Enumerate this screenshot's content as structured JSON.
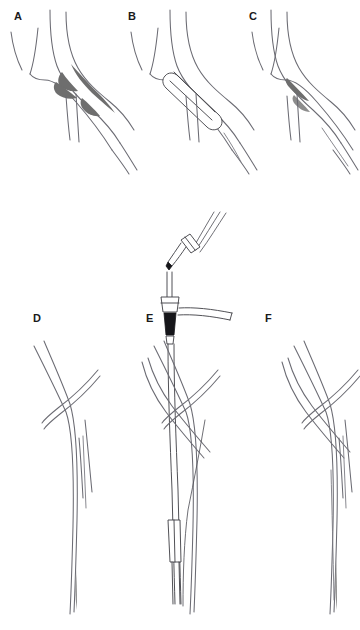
{
  "figure": {
    "kind": "medical-illustration",
    "style": "black-and-white line drawing",
    "background_color": "#ffffff",
    "line_color": "#6b6b73",
    "device_color": "#3d3d43",
    "plaque_color": "#6e6e6e",
    "valve_color": "#16161a",
    "label_color": "#1a1a1a",
    "panel_count": 6,
    "grid": "3 columns x 2 rows"
  },
  "panels": [
    {
      "id": "A",
      "label": "A",
      "label_x": 14,
      "label_y": 20,
      "row": 1,
      "column": 1,
      "content": "Arterial bifurcation with stenotic plaque shaded dark gray at the origin of the branch vessels"
    },
    {
      "id": "B",
      "label": "B",
      "label_x": 128,
      "label_y": 20,
      "row": 1,
      "column": 2,
      "content": "Elongated stent or balloon catheter deployed across the stenosis at the bifurcation"
    },
    {
      "id": "C",
      "label": "C",
      "label_x": 249,
      "label_y": 20,
      "row": 1,
      "column": 3,
      "content": "Bifurcation after treatment showing reduced residual plaque and restored lumen"
    },
    {
      "id": "D",
      "label": "D",
      "label_x": 33,
      "label_y": 322,
      "row": 2,
      "column": 1,
      "content": "Long arterial segment with crossing overlying vessels before device insertion"
    },
    {
      "id": "E",
      "label": "E",
      "label_x": 146,
      "label_y": 322,
      "row": 2,
      "column": 2,
      "content": "Introducer sheath with hemostatic valve hub and side-arm extension, access needle and guidewire connector above, catheter shaft advanced down the vessel with a distal marker band"
    },
    {
      "id": "F",
      "label": "F",
      "label_x": 265,
      "label_y": 322,
      "row": 2,
      "column": 3,
      "content": "Arterial segment after device removal showing patent vessel"
    }
  ],
  "device_parts": [
    {
      "name": "guidewire-connector",
      "description": "small cylindrical connector on angled guidewire at top of panel E"
    },
    {
      "name": "access-needle",
      "description": "tapered needle leading into the sheath hub"
    },
    {
      "name": "sheath-hub",
      "description": "hemostatic valve hub body"
    },
    {
      "name": "side-arm",
      "description": "angled side-arm flush extension tubing"
    },
    {
      "name": "valve-lever",
      "description": "dark hemostatic valve lever below hub"
    },
    {
      "name": "catheter-shaft",
      "description": "long shaft running down the vessel"
    },
    {
      "name": "marker-band",
      "description": "radiopaque marker band near distal shaft"
    },
    {
      "name": "stent",
      "description": "elongated rounded stent body in panel B"
    }
  ]
}
